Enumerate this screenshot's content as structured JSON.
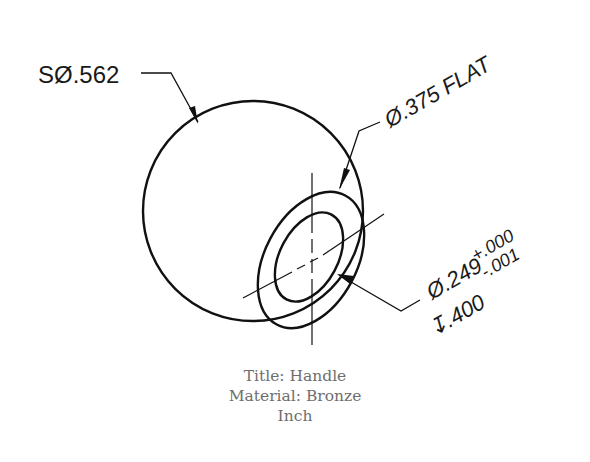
{
  "drawing": {
    "title_label": "Title: Handle",
    "material_label": "Material: Bronze",
    "units_label": "Inch",
    "callouts": {
      "sphere_diameter": "SØ.562",
      "flat_diameter": "Ø.375 FLAT",
      "hole_diameter": "Ø.249",
      "hole_tol_upper": "+.000",
      "hole_tol_lower": "-.001",
      "hole_depth": "↧.400"
    },
    "colors": {
      "line": "#111111",
      "caption_text": "#6e6e6e"
    }
  }
}
